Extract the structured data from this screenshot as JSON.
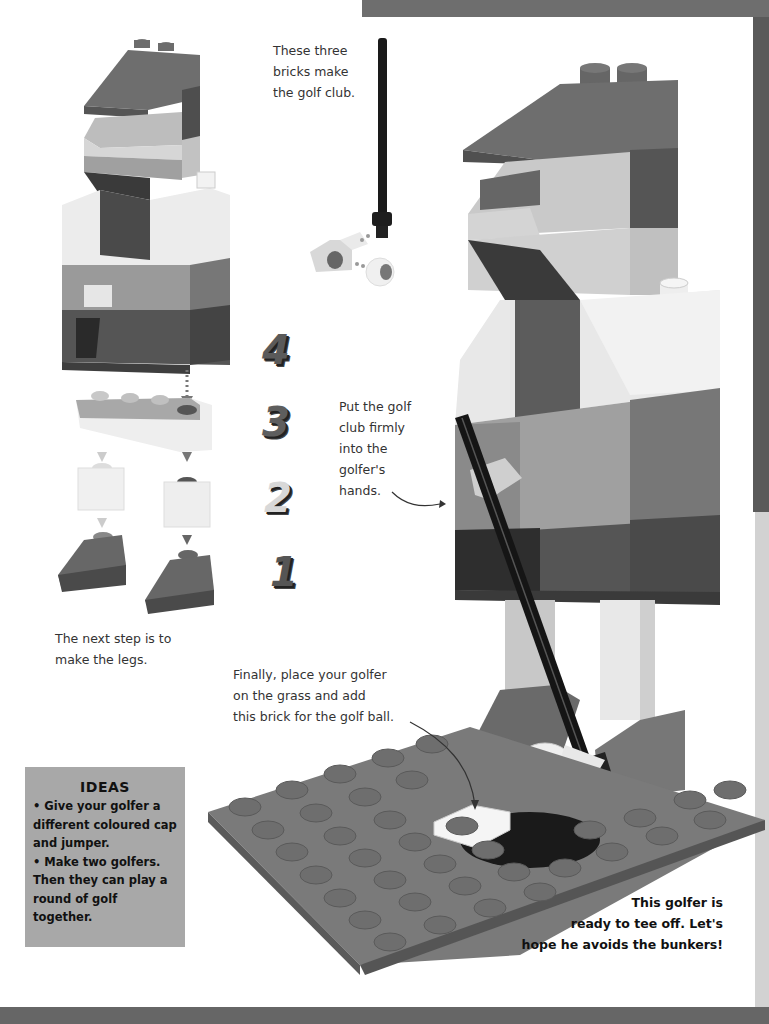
{
  "page": {
    "captions": {
      "club_bricks": "These three\nbricks make\nthe golf club.",
      "put_club": "Put the golf\nclub firmly\ninto the\ngolfer's\nhands.",
      "next_step_legs": "The next step is to\nmake the legs.",
      "finally_place": "Finally, place your golfer\non the grass and add\nthis brick for the golf ball.",
      "ready_tee_off": "This golfer is\nready to tee off. Let's\nhope he avoids the bunkers!"
    },
    "ideas_box": {
      "title": "IDEAS",
      "items": [
        "• Give your golfer a different coloured cap and jumper.",
        "• Make two golfers. Then they can play a round of golf together."
      ]
    },
    "steps": [
      {
        "number": "4",
        "color": "#5a5a5a"
      },
      {
        "number": "3",
        "color": "#5e5e5e"
      },
      {
        "number": "2",
        "color": "#d8d8d8"
      },
      {
        "number": "1",
        "color": "#555555"
      }
    ],
    "stud_logo": "LEGO",
    "colors": {
      "cap": "#6a6a6a",
      "face": "#cfcfcf",
      "jumper": "#999999",
      "trousers": "#555555",
      "baseplate": "#7a7a7a",
      "club": "#1a1a1a",
      "ideas_bg": "#a8a8a8"
    }
  }
}
